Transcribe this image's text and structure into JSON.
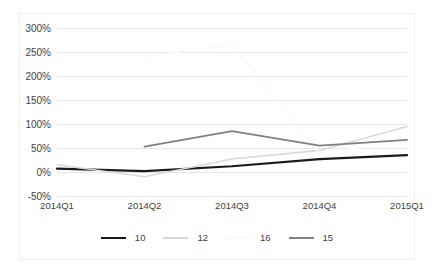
{
  "chart_data": {
    "type": "line",
    "title": "",
    "subtitle": "",
    "xlabel": "",
    "ylabel": "",
    "categories": [
      "2014Q1",
      "2014Q2",
      "2014Q3",
      "2014Q4",
      "2015Q1"
    ],
    "ylim": [
      -50,
      300
    ],
    "yticks": [
      300,
      250,
      200,
      150,
      100,
      50,
      0,
      -50
    ],
    "ytick_labels": [
      "300%",
      "250%",
      "200%",
      "150%",
      "100%",
      "50%",
      "0%",
      "-50%"
    ],
    "grid": true,
    "legend_position": "bottom",
    "series": [
      {
        "name": "10",
        "color": "#1a1a1a",
        "width": 2.2,
        "values": [
          7,
          2,
          12,
          27,
          35
        ]
      },
      {
        "name": "12",
        "color": "#d9d9d9",
        "width": 1.6,
        "values": [
          15,
          -10,
          27,
          45,
          95
        ]
      },
      {
        "name": "16",
        "color": "#fafafa",
        "width": 1.6,
        "values": [
          null,
          240,
          265,
          40,
          62
        ]
      },
      {
        "name": "15",
        "color": "#808080",
        "width": 1.8,
        "values": [
          null,
          53,
          85,
          55,
          67
        ]
      }
    ]
  },
  "legend": {
    "entries": [
      {
        "label": "10"
      },
      {
        "label": "12"
      },
      {
        "label": "16"
      },
      {
        "label": "15"
      }
    ]
  }
}
